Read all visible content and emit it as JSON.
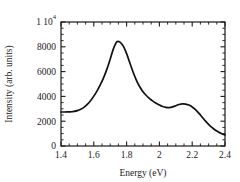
{
  "chart_data": {
    "type": "line",
    "title": "",
    "xlabel": "Energy (eV)",
    "ylabel": "Intensity (arb. units)",
    "xlim": [
      1.4,
      2.4
    ],
    "ylim": [
      0,
      10000
    ],
    "grid": false,
    "legend": null,
    "xticks": [
      1.4,
      1.6,
      1.8,
      2.0,
      2.2,
      2.4
    ],
    "xtick_labels": [
      "1.4",
      "1.6",
      "1.8",
      "2",
      "2.2",
      "2.4"
    ],
    "x_minor_tick_step": 0.05,
    "yticks": [
      0,
      2000,
      4000,
      6000,
      8000,
      10000
    ],
    "ytick_labels": [
      "0",
      "2000",
      "4000",
      "6000",
      "8000",
      "1 10"
    ],
    "ytick_top_exponent": "4",
    "y_minor_tick_step": 500,
    "series": [
      {
        "name": "emission spectrum",
        "color": "#111111",
        "x": [
          1.4,
          1.42,
          1.44,
          1.46,
          1.48,
          1.5,
          1.52,
          1.54,
          1.56,
          1.58,
          1.6,
          1.62,
          1.64,
          1.66,
          1.68,
          1.7,
          1.72,
          1.74,
          1.76,
          1.78,
          1.8,
          1.82,
          1.84,
          1.86,
          1.88,
          1.9,
          1.92,
          1.94,
          1.96,
          1.98,
          2.0,
          2.02,
          2.04,
          2.06,
          2.08,
          2.1,
          2.12,
          2.14,
          2.16,
          2.18,
          2.2,
          2.22,
          2.24,
          2.26,
          2.28,
          2.3,
          2.32,
          2.34,
          2.36,
          2.38,
          2.4
        ],
        "y": [
          2740,
          2740,
          2745,
          2760,
          2790,
          2850,
          2960,
          3120,
          3350,
          3650,
          4020,
          4450,
          4950,
          5520,
          6200,
          7000,
          7850,
          8400,
          8380,
          8050,
          7450,
          6700,
          5950,
          5300,
          4780,
          4380,
          4070,
          3820,
          3620,
          3450,
          3300,
          3180,
          3110,
          3100,
          3150,
          3250,
          3350,
          3400,
          3380,
          3300,
          3150,
          2930,
          2650,
          2340,
          2030,
          1750,
          1500,
          1290,
          1120,
          990,
          900
        ]
      }
    ],
    "annotations": {
      "main_peak": {
        "x": 1.74,
        "y": 8400
      },
      "valley": {
        "x": 2.06,
        "y": 3100
      },
      "secondary_peak": {
        "x": 2.14,
        "y": 3400
      },
      "left_baseline": {
        "x": 1.4,
        "y": 2740
      },
      "right_end": {
        "x": 2.4,
        "y": 900
      }
    }
  },
  "figure": {
    "background": "#ffffff",
    "foreground": "#1a1a1a"
  }
}
